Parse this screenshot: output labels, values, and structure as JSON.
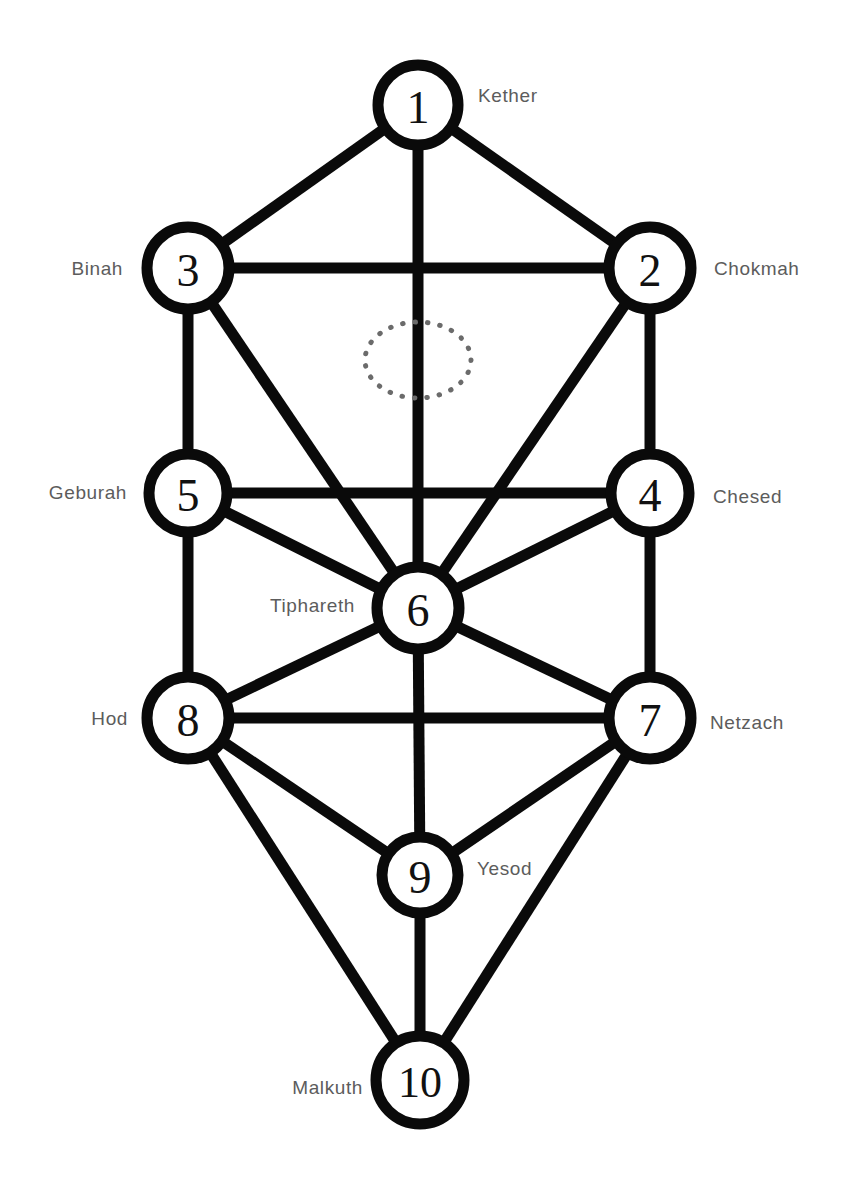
{
  "diagram": {
    "canvas": {
      "width": 851,
      "height": 1177
    },
    "stroke_color": "#0a0a0a",
    "node_fill_color": "#ffffff",
    "label_color": "#5c5c5c",
    "daath_color": "#6b6b6b"
  },
  "nodes": [
    {
      "id": 1,
      "number": "1",
      "label": "Kether",
      "cx": 418,
      "cy": 105,
      "r": 40,
      "label_side": "right",
      "label_x": 478,
      "label_y": 95
    },
    {
      "id": 2,
      "number": "2",
      "label": "Chokmah",
      "cx": 650,
      "cy": 268,
      "r": 41,
      "label_side": "right",
      "label_x": 714,
      "label_y": 268
    },
    {
      "id": 3,
      "number": "3",
      "label": "Binah",
      "cx": 188,
      "cy": 268,
      "r": 41,
      "label_side": "left",
      "label_x": 123,
      "label_y": 268
    },
    {
      "id": 4,
      "number": "4",
      "label": "Chesed",
      "cx": 650,
      "cy": 493,
      "r": 39,
      "label_side": "right",
      "label_x": 713,
      "label_y": 496
    },
    {
      "id": 5,
      "number": "5",
      "label": "Geburah",
      "cx": 188,
      "cy": 493,
      "r": 39,
      "label_side": "left",
      "label_x": 127,
      "label_y": 492
    },
    {
      "id": 6,
      "number": "6",
      "label": "Tiphareth",
      "cx": 418,
      "cy": 608,
      "r": 41,
      "label_side": "left",
      "label_x": 355,
      "label_y": 605
    },
    {
      "id": 7,
      "number": "7",
      "label": "Netzach",
      "cx": 650,
      "cy": 718,
      "r": 41,
      "label_side": "right",
      "label_x": 710,
      "label_y": 722
    },
    {
      "id": 8,
      "number": "8",
      "label": "Hod",
      "cx": 188,
      "cy": 718,
      "r": 41,
      "label_side": "left",
      "label_x": 128,
      "label_y": 718
    },
    {
      "id": 9,
      "number": "9",
      "label": "Yesod",
      "cx": 420,
      "cy": 875,
      "r": 38,
      "label_side": "right",
      "label_x": 477,
      "label_y": 868
    },
    {
      "id": 10,
      "number": "10",
      "label": "Malkuth",
      "cx": 420,
      "cy": 1080,
      "r": 44,
      "label_side": "left",
      "label_x": 363,
      "label_y": 1087
    }
  ],
  "edges": [
    {
      "from": 1,
      "to": 3
    },
    {
      "from": 1,
      "to": 2
    },
    {
      "from": 1,
      "to": 6
    },
    {
      "from": 3,
      "to": 2
    },
    {
      "from": 3,
      "to": 5
    },
    {
      "from": 3,
      "to": 6
    },
    {
      "from": 2,
      "to": 4
    },
    {
      "from": 2,
      "to": 6
    },
    {
      "from": 5,
      "to": 4
    },
    {
      "from": 5,
      "to": 6
    },
    {
      "from": 5,
      "to": 8
    },
    {
      "from": 4,
      "to": 6
    },
    {
      "from": 4,
      "to": 7
    },
    {
      "from": 6,
      "to": 8
    },
    {
      "from": 6,
      "to": 7
    },
    {
      "from": 6,
      "to": 9
    },
    {
      "from": 8,
      "to": 7
    },
    {
      "from": 8,
      "to": 9
    },
    {
      "from": 8,
      "to": 10
    },
    {
      "from": 7,
      "to": 9
    },
    {
      "from": 7,
      "to": 10
    },
    {
      "from": 9,
      "to": 10
    }
  ],
  "daath": {
    "name": "daath-ellipse",
    "cx": 418,
    "cy": 360,
    "rx": 53,
    "ry": 38
  }
}
